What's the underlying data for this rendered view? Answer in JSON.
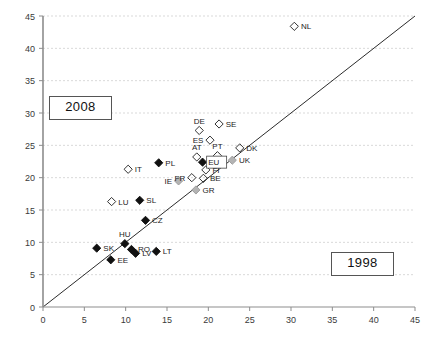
{
  "chart_data": {
    "type": "scatter",
    "title": "",
    "xlabel": "",
    "ylabel": "",
    "xlim": [
      0,
      45
    ],
    "ylim": [
      0,
      45
    ],
    "xticks": [
      0,
      5,
      10,
      15,
      20,
      25,
      30,
      35,
      40,
      45
    ],
    "yticks": [
      0,
      5,
      10,
      15,
      20,
      25,
      30,
      35,
      40,
      45
    ],
    "grid": true,
    "grid_style": "dashed",
    "legend": "none",
    "reference_line": {
      "type": "diagonal",
      "from": [
        0,
        0
      ],
      "to": [
        45,
        45
      ]
    },
    "annotations": [
      {
        "text": "2008",
        "position": "upper-left",
        "boxed": true
      },
      {
        "text": "1998",
        "position": "lower-right",
        "boxed": true
      }
    ],
    "marker_styles": {
      "open_diamond": "hollow diamond outline",
      "filled_diamond": "solid black diamond",
      "grey_diamond": "grey filled diamond"
    },
    "points": [
      {
        "label": "NL",
        "x": 30.4,
        "y": 43.4,
        "marker": "open_diamond",
        "label_pos": "right"
      },
      {
        "label": "DE",
        "x": 18.9,
        "y": 27.3,
        "marker": "open_diamond",
        "label_pos": "above"
      },
      {
        "label": "SE",
        "x": 21.3,
        "y": 28.3,
        "marker": "open_diamond",
        "label_pos": "right"
      },
      {
        "label": "ES",
        "x": 20.2,
        "y": 25.8,
        "marker": "open_diamond",
        "label_pos": "left"
      },
      {
        "label": "DK",
        "x": 23.8,
        "y": 24.6,
        "marker": "open_diamond",
        "label_pos": "right"
      },
      {
        "label": "AT",
        "x": 18.6,
        "y": 23.2,
        "marker": "open_diamond",
        "label_pos": "above"
      },
      {
        "label": "EU",
        "x": 19.3,
        "y": 22.4,
        "marker": "filled_diamond",
        "label_pos": "boxed-right"
      },
      {
        "label": "PT",
        "x": 21.1,
        "y": 23.4,
        "marker": "open_diamond",
        "label_pos": "above"
      },
      {
        "label": "UK",
        "x": 22.9,
        "y": 22.7,
        "marker": "grey_diamond",
        "label_pos": "right"
      },
      {
        "label": "PL",
        "x": 14.0,
        "y": 22.3,
        "marker": "filled_diamond",
        "label_pos": "right"
      },
      {
        "label": "IT",
        "x": 10.3,
        "y": 21.3,
        "marker": "open_diamond",
        "label_pos": "right"
      },
      {
        "label": "FI",
        "x": 19.7,
        "y": 21.2,
        "marker": "open_diamond",
        "label_pos": "right"
      },
      {
        "label": "FR",
        "x": 18.0,
        "y": 20.0,
        "marker": "open_diamond",
        "label_pos": "left"
      },
      {
        "label": "BE",
        "x": 19.4,
        "y": 19.9,
        "marker": "open_diamond",
        "label_pos": "right"
      },
      {
        "label": "IE",
        "x": 16.4,
        "y": 19.5,
        "marker": "grey_diamond",
        "label_pos": "left"
      },
      {
        "label": "GR",
        "x": 18.5,
        "y": 18.1,
        "marker": "grey_diamond",
        "label_pos": "right"
      },
      {
        "label": "SL",
        "x": 11.7,
        "y": 16.5,
        "marker": "filled_diamond",
        "label_pos": "right"
      },
      {
        "label": "LU",
        "x": 8.3,
        "y": 16.3,
        "marker": "open_diamond",
        "label_pos": "right"
      },
      {
        "label": "CZ",
        "x": 12.4,
        "y": 13.4,
        "marker": "filled_diamond",
        "label_pos": "right"
      },
      {
        "label": "HU",
        "x": 9.9,
        "y": 9.8,
        "marker": "filled_diamond",
        "label_pos": "above"
      },
      {
        "label": "SK",
        "x": 6.5,
        "y": 9.1,
        "marker": "filled_diamond",
        "label_pos": "right"
      },
      {
        "label": "RO",
        "x": 10.7,
        "y": 8.9,
        "marker": "filled_diamond",
        "label_pos": "right"
      },
      {
        "label": "LV",
        "x": 11.2,
        "y": 8.3,
        "marker": "filled_diamond",
        "label_pos": "right"
      },
      {
        "label": "LT",
        "x": 13.7,
        "y": 8.6,
        "marker": "filled_diamond",
        "label_pos": "right"
      },
      {
        "label": "EE",
        "x": 8.2,
        "y": 7.3,
        "marker": "filled_diamond",
        "label_pos": "right"
      }
    ]
  },
  "annotations": {
    "era_left": "2008",
    "era_right": "1998"
  }
}
